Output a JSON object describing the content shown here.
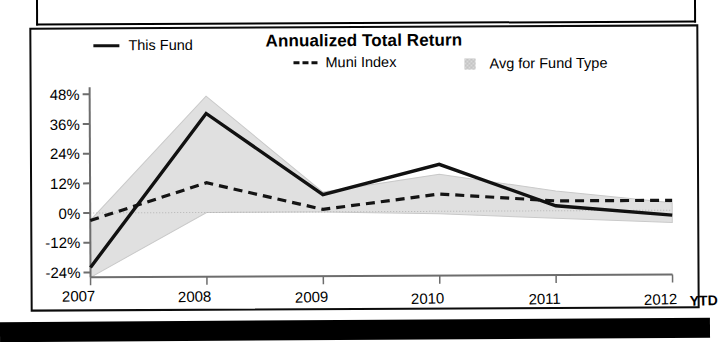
{
  "chart_data": {
    "type": "line",
    "title": "Annualized Total Return",
    "xlabel": "",
    "ylabel": "",
    "categories": [
      "2007",
      "2008",
      "2009",
      "2010",
      "2011",
      "2012"
    ],
    "x_axis_suffix_label": "YTD",
    "x_tick_labels": [
      "2007",
      "2008",
      "2009",
      "2010",
      "2011",
      "2012"
    ],
    "y_tick_labels": [
      "48%",
      "36%",
      "24%",
      "12%",
      "0%",
      "-12%",
      "-24%"
    ],
    "y_tick_values": [
      48,
      36,
      24,
      12,
      0,
      -12,
      -24
    ],
    "ylim": [
      -26,
      50
    ],
    "grid": false,
    "legend_position": "top",
    "series": [
      {
        "name": "This Fund",
        "style": "solid",
        "color": "#111111",
        "values": [
          -22,
          40,
          7,
          19,
          2,
          -2
        ]
      },
      {
        "name": "Muni Index",
        "style": "dashed",
        "color": "#111111",
        "values": [
          -3,
          12,
          1,
          7,
          4,
          4
        ]
      },
      {
        "name": "Avg for Fund Type",
        "style": "band",
        "color": "#dedede",
        "band_upper": [
          -3,
          47,
          8,
          15,
          8,
          3
        ],
        "band_lower": [
          -26,
          0,
          0,
          -1,
          -3,
          -5
        ]
      }
    ]
  },
  "legend": {
    "items": [
      {
        "label": "This Fund",
        "marker": "solid-line-swatch"
      },
      {
        "label": "Muni Index",
        "marker": "dashed-line-swatch"
      },
      {
        "label": "Avg for Fund Type",
        "marker": "shaded-band-swatch"
      }
    ]
  }
}
